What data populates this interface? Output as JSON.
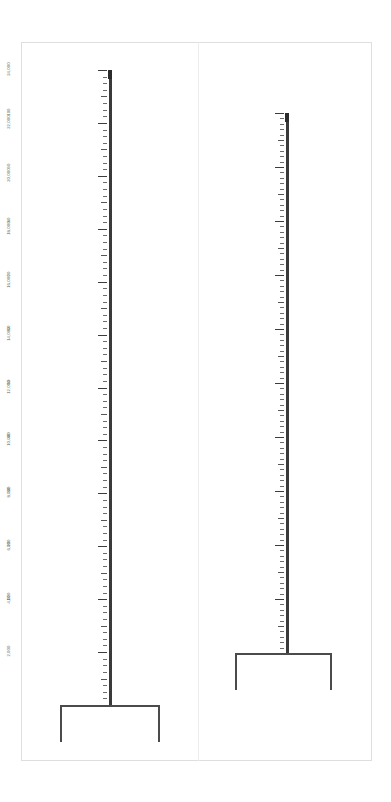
{
  "page": {
    "background_color": "#ffffff",
    "frame_color": "#dededd",
    "divider_color": "#ececec",
    "ink_color": "#3a3a3a",
    "label_color": "#5d5d5d",
    "orientation": "labels rotated 90 degrees (sideways page)"
  },
  "chart_data": [
    {
      "id": "left-scale",
      "type": "bar",
      "title": "",
      "xlabel": "",
      "ylabel": "",
      "categories": [
        ""
      ],
      "values": [
        24000
      ],
      "ylim": [
        0,
        24000
      ],
      "axis_tick_labels": [
        "2,000",
        "4,000",
        "6,000",
        "8,000",
        "10,000",
        "12,000",
        "14,000",
        "16,000",
        "18,000",
        "20,000",
        "22,000",
        "24,000"
      ],
      "axis_major_values": [
        2000,
        4000,
        6000,
        8000,
        10000,
        12000,
        14000,
        16000,
        18000,
        20000,
        22000,
        24000
      ],
      "axis_major_step": 2000,
      "axis_minor_step": 250,
      "axis_mid_step": 1000,
      "grid": false,
      "legend": "none",
      "annotations": []
    },
    {
      "id": "right-scale",
      "type": "bar",
      "title": "",
      "xlabel": "",
      "ylabel": "",
      "categories": [
        ""
      ],
      "values": [
        100
      ],
      "ylim": [
        0,
        100
      ],
      "axis_tick_labels": [
        "10",
        "20",
        "30",
        "40",
        "50",
        "60",
        "70",
        "80",
        "90",
        "100"
      ],
      "axis_major_values": [
        10,
        20,
        30,
        40,
        50,
        60,
        70,
        80,
        90,
        100
      ],
      "axis_major_step": 10,
      "axis_minor_step": 1,
      "axis_mid_step": 5,
      "grid": false,
      "legend": "none",
      "annotations": []
    }
  ],
  "left_panel": {
    "scale_labels": [
      {
        "value": 24000,
        "text": "24,000"
      },
      {
        "value": 22000,
        "text": "22,000"
      },
      {
        "value": 20000,
        "text": "20,000"
      },
      {
        "value": 18000,
        "text": "18,000"
      },
      {
        "value": 16000,
        "text": "16,000"
      },
      {
        "value": 14000,
        "text": "14,000"
      },
      {
        "value": 12000,
        "text": "12,000"
      },
      {
        "value": 10000,
        "text": "10,000"
      },
      {
        "value": 8000,
        "text": "8,000"
      },
      {
        "value": 6000,
        "text": "6,000"
      },
      {
        "value": 4000,
        "text": "4,000"
      },
      {
        "value": 2000,
        "text": "2,000"
      }
    ]
  },
  "right_panel": {
    "scale_labels": [
      {
        "value": 100,
        "text": "100"
      },
      {
        "value": 90,
        "text": "90"
      },
      {
        "value": 80,
        "text": "80"
      },
      {
        "value": 70,
        "text": "70"
      },
      {
        "value": 60,
        "text": "60"
      },
      {
        "value": 50,
        "text": "50"
      },
      {
        "value": 40,
        "text": "40"
      },
      {
        "value": 30,
        "text": "30"
      },
      {
        "value": 20,
        "text": "20"
      },
      {
        "value": 10,
        "text": "10"
      }
    ]
  }
}
